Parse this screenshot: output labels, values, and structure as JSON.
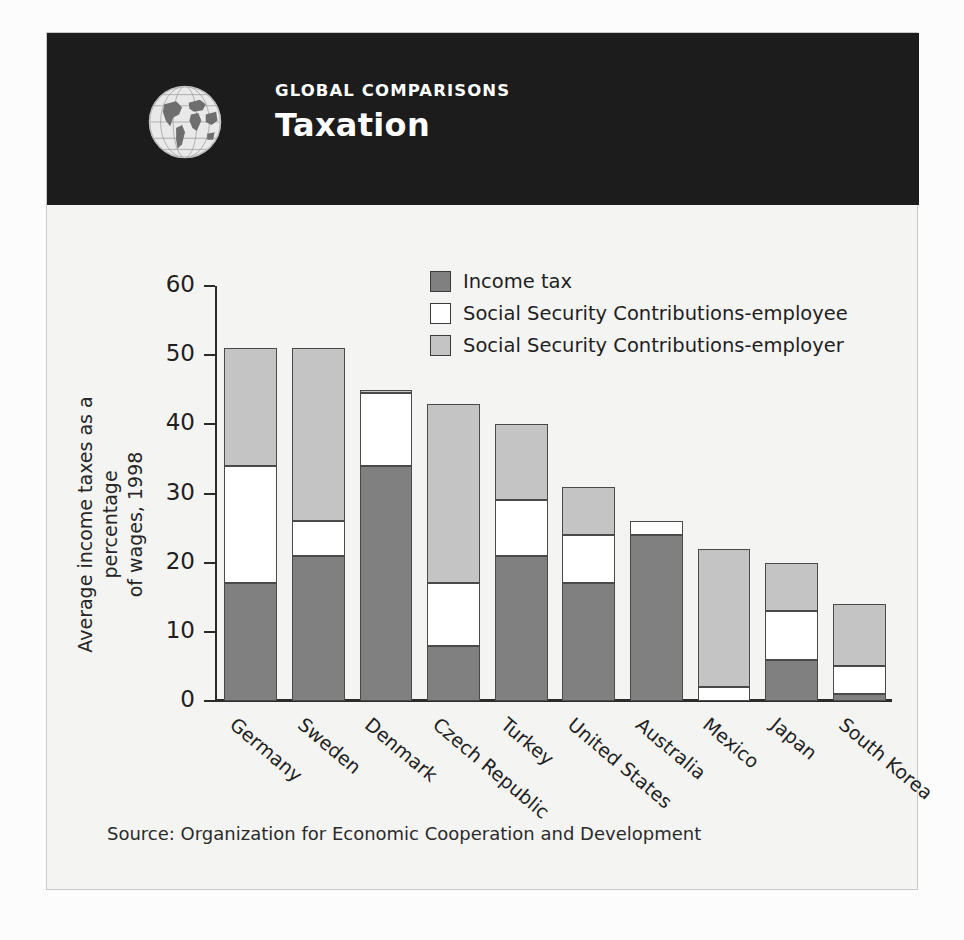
{
  "header": {
    "kicker": "GLOBAL COMPARISONS",
    "title": "Taxation",
    "globe_icon": "globe-icon",
    "background_color": "#1c1c1c",
    "text_color": "#ffffff"
  },
  "source": "Source: Organization for Economic Cooperation and Development",
  "colors": {
    "income_tax": "#808080",
    "ssc_employee": "#ffffff",
    "ssc_employer": "#c4c4c4",
    "axis": "#2b2b2b",
    "panel": "#f4f4f2"
  },
  "chart_data": {
    "type": "bar",
    "stacked": true,
    "title": "Taxation",
    "subtitle": "GLOBAL COMPARISONS",
    "xlabel": "",
    "ylabel": "Average income taxes as a percentage of wages, 1998",
    "ylabel_lines": [
      "Average income taxes as a percentage",
      "of wages, 1998"
    ],
    "ylim": [
      0,
      60
    ],
    "yticks": [
      0,
      10,
      20,
      30,
      40,
      50,
      60
    ],
    "ytick_labels": [
      "0",
      "10",
      "20",
      "30",
      "40",
      "50",
      "60"
    ],
    "grid": false,
    "legend_position": "top-center",
    "categories": [
      "Germany",
      "Sweden",
      "Denmark",
      "Czech Republic",
      "Turkey",
      "United States",
      "Australia",
      "Mexico",
      "Japan",
      "South Korea"
    ],
    "series": [
      {
        "name": "Income tax",
        "color": "#808080",
        "values": [
          17,
          21,
          34,
          8,
          21,
          17,
          24,
          0,
          6,
          1
        ]
      },
      {
        "name": "Social Security Contributions-employee",
        "color": "#ffffff",
        "values": [
          17,
          5,
          10.5,
          9,
          8,
          7,
          2,
          2,
          7,
          4
        ]
      },
      {
        "name": "Social Security Contributions-employer",
        "color": "#c4c4c4",
        "values": [
          17,
          25,
          0.5,
          26,
          11,
          7,
          0,
          20,
          7,
          9
        ]
      }
    ],
    "totals": [
      51,
      51,
      45,
      43,
      40,
      31,
      26,
      22,
      20,
      14
    ],
    "annotations": [],
    "source": "Source: Organization for Economic Cooperation and Development"
  }
}
